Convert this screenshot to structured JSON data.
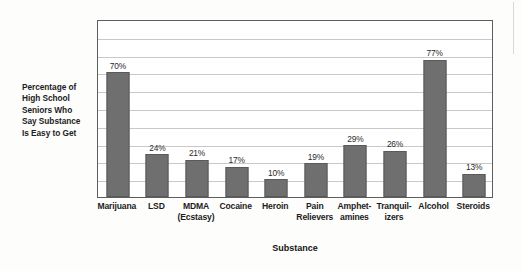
{
  "chart_data": {
    "type": "bar",
    "title": "",
    "xlabel": "Substance",
    "ylabel": "Percentage of High School Seniors Who Say Substance Is Easy to Get",
    "ylabel_lines": [
      "Percentage of",
      "High School",
      "Seniors Who",
      "Say Substance",
      "Is Easy to Get"
    ],
    "categories": [
      "Marijuana",
      "LSD",
      "MDMA (Ecstasy)",
      "Cocaine",
      "Heroin",
      "Pain Relievers",
      "Amphetamines",
      "Tranquilizers",
      "Alcohol",
      "Steroids"
    ],
    "category_label_lines": [
      [
        "Marijuana"
      ],
      [
        "LSD"
      ],
      [
        "MDMA",
        "(Ecstasy)"
      ],
      [
        "Cocaine"
      ],
      [
        "Heroin"
      ],
      [
        "Pain",
        "Relievers"
      ],
      [
        "Amphet-",
        "amines"
      ],
      [
        "Tranquil-",
        "izers"
      ],
      [
        "Alcohol"
      ],
      [
        "Steroids"
      ]
    ],
    "values": [
      70,
      24,
      21,
      17,
      10,
      19,
      29,
      26,
      77,
      13
    ],
    "value_labels": [
      "70%",
      "24%",
      "21%",
      "17%",
      "10%",
      "19%",
      "29%",
      "26%",
      "77%",
      "13%"
    ],
    "ylim": [
      0,
      100
    ],
    "gridline_interval": 10,
    "grid": true,
    "legend": false,
    "bar_color": "#6f6f6f",
    "bar_border_color": "#5a5a5a",
    "grid_color": "#c9c9c9",
    "frame_color": "#5d5d5d",
    "background_color": "#ffffff"
  }
}
